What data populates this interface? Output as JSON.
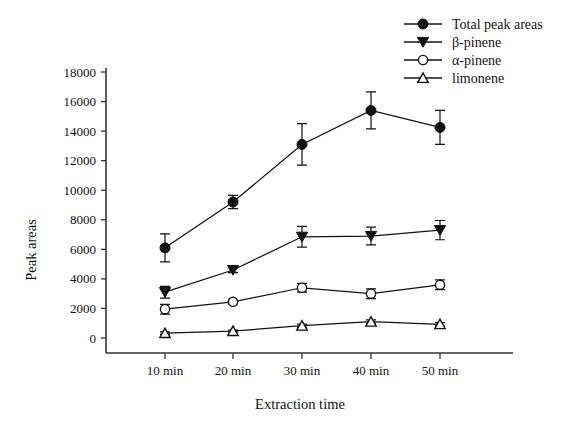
{
  "chart_data": {
    "type": "line",
    "title": "",
    "xlabel": "Extraction time",
    "ylabel": "Peak areas",
    "categories": [
      "10 min",
      "20 min",
      "30 min",
      "40 min",
      "50 min"
    ],
    "ylim": [
      0,
      18000
    ],
    "ytick_step": 2000,
    "yticks": [
      "0",
      "2000",
      "4000",
      "6000",
      "8000",
      "10000",
      "12000",
      "14000",
      "16000",
      "18000"
    ],
    "grid": false,
    "legend_position": "top-right",
    "series": [
      {
        "name": "Total peak areas",
        "marker": "filled-circle",
        "values": [
          6100,
          9200,
          13100,
          15400,
          14250
        ],
        "errors": [
          950,
          450,
          1400,
          1250,
          1150
        ]
      },
      {
        "name": "β-pinene",
        "marker": "filled-triangle-down",
        "values": [
          3100,
          4600,
          6850,
          6900,
          7300
        ],
        "errors": [
          400,
          180,
          700,
          600,
          650
        ]
      },
      {
        "name": "α-pinene",
        "marker": "open-circle",
        "values": [
          1950,
          2450,
          3400,
          3000,
          3600
        ],
        "errors": [
          330,
          120,
          300,
          330,
          330
        ]
      },
      {
        "name": "limonene",
        "marker": "open-triangle-up",
        "values": [
          330,
          470,
          830,
          1100,
          930
        ],
        "errors": [
          90,
          60,
          110,
          130,
          110
        ]
      }
    ]
  },
  "axis": {
    "ylabel": "Peak areas",
    "xlabel": "Extraction time"
  },
  "legend": {
    "items": [
      {
        "label": "Total peak areas",
        "marker": "filled-circle"
      },
      {
        "label": "β-pinene",
        "marker": "filled-triangle-down"
      },
      {
        "label": "α-pinene",
        "marker": "open-circle"
      },
      {
        "label": "limonene",
        "marker": "open-triangle-up"
      }
    ]
  }
}
